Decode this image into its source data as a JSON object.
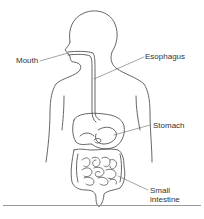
{
  "diagram": {
    "labels": {
      "mouth": "Mouth",
      "esophagus": "Esophagus",
      "stomach": "Stomach",
      "small_intestine_line1": "Small",
      "small_intestine_line2": "intestine"
    },
    "colors": {
      "stroke": "#555555",
      "text": "#333333",
      "rule": "#9a9a9a"
    }
  }
}
